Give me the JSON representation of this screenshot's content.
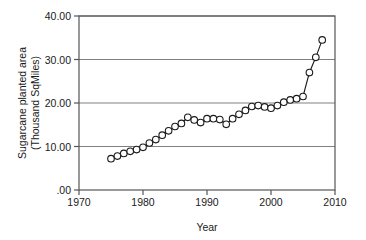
{
  "chart_data": {
    "type": "line",
    "title": "",
    "xlabel": "Year",
    "ylabel": "Sugarcane planted area (Thousand SqMiles)",
    "ylabel_line1": "Sugarcane planted area",
    "ylabel_line2": "(Thousand SqMiles)",
    "xlim": [
      1970,
      2010
    ],
    "ylim": [
      0,
      40
    ],
    "xticks": [
      1970,
      1980,
      1990,
      2000,
      2010
    ],
    "xtick_labels": [
      "1970",
      "1980",
      "1990",
      "2000",
      "2010"
    ],
    "yticks": [
      0,
      10,
      20,
      30,
      40
    ],
    "ytick_labels": [
      ".00",
      "10.00",
      "20.00",
      "30.00",
      "40.00"
    ],
    "grid": "horizontal",
    "legend": "none",
    "marker": "open-circle",
    "line_color": "#1a1a1a",
    "marker_fill": "#ffffff",
    "grid_color": "#808080",
    "axis_color": "#555555",
    "x": [
      1975,
      1976,
      1977,
      1978,
      1979,
      1980,
      1981,
      1982,
      1983,
      1984,
      1985,
      1986,
      1987,
      1988,
      1989,
      1990,
      1991,
      1992,
      1993,
      1994,
      1995,
      1996,
      1997,
      1998,
      1999,
      2000,
      2001,
      2002,
      2003,
      2004,
      2005,
      2006,
      2007,
      2008
    ],
    "values": [
      7.2,
      7.8,
      8.4,
      8.9,
      9.3,
      9.8,
      10.8,
      11.6,
      12.6,
      13.6,
      14.6,
      15.3,
      16.7,
      16.1,
      15.5,
      16.4,
      16.4,
      16.2,
      15.1,
      16.4,
      17.4,
      18.3,
      19.2,
      19.4,
      19.1,
      18.8,
      19.4,
      20.2,
      20.7,
      21.0,
      21.5,
      27.0,
      30.5,
      34.5
    ]
  }
}
